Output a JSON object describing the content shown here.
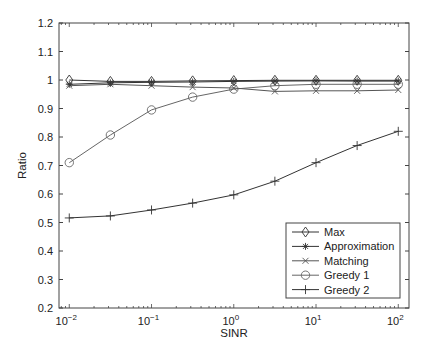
{
  "chart_data": {
    "type": "line",
    "title": "",
    "xlabel": "SINR",
    "ylabel": "Ratio",
    "xscale": "log",
    "x": [
      0.01,
      0.0316,
      0.1,
      0.316,
      1,
      3.16,
      10,
      31.6,
      100
    ],
    "xlim": [
      0.0075,
      135
    ],
    "ylim": [
      0.2,
      1.2
    ],
    "xticks": [
      {
        "value": 0.01,
        "base": "10",
        "exp": "-2"
      },
      {
        "value": 0.1,
        "base": "10",
        "exp": "-1"
      },
      {
        "value": 1,
        "base": "10",
        "exp": "0"
      },
      {
        "value": 10,
        "base": "10",
        "exp": "1"
      },
      {
        "value": 100,
        "base": "10",
        "exp": "2"
      }
    ],
    "yticks": [
      0.2,
      0.3,
      0.4,
      0.5,
      0.6,
      0.7,
      0.8,
      0.9,
      1,
      1.1,
      1.2
    ],
    "ytick_labels": [
      "0.2",
      "0.3",
      "0.4",
      "0.5",
      "0.6",
      "0.7",
      "0.8",
      "0.9",
      "1",
      "1.1",
      "1.2"
    ],
    "grid": false,
    "legend_position": "lower right",
    "series": [
      {
        "name": "Max",
        "marker": "diamond",
        "color": "#333333",
        "values": [
          1.0,
          0.995,
          0.995,
          0.997,
          0.998,
          0.999,
          0.999,
          0.999,
          0.999
        ]
      },
      {
        "name": "Approximation",
        "marker": "asterisk",
        "color": "#333333",
        "values": [
          0.985,
          0.99,
          0.992,
          0.993,
          0.995,
          0.996,
          0.997,
          0.996,
          0.996
        ]
      },
      {
        "name": "Matching",
        "marker": "x",
        "color": "#555555",
        "values": [
          0.98,
          0.985,
          0.98,
          0.975,
          0.972,
          0.96,
          0.962,
          0.962,
          0.965
        ]
      },
      {
        "name": "Greedy 1",
        "marker": "circle",
        "color": "#666666",
        "values": [
          0.71,
          0.807,
          0.895,
          0.94,
          0.968,
          0.98,
          0.985,
          0.985,
          0.985
        ]
      },
      {
        "name": "Greedy 2",
        "marker": "plus",
        "color": "#333333",
        "values": [
          0.516,
          0.523,
          0.544,
          0.568,
          0.597,
          0.645,
          0.71,
          0.77,
          0.82
        ]
      }
    ]
  }
}
